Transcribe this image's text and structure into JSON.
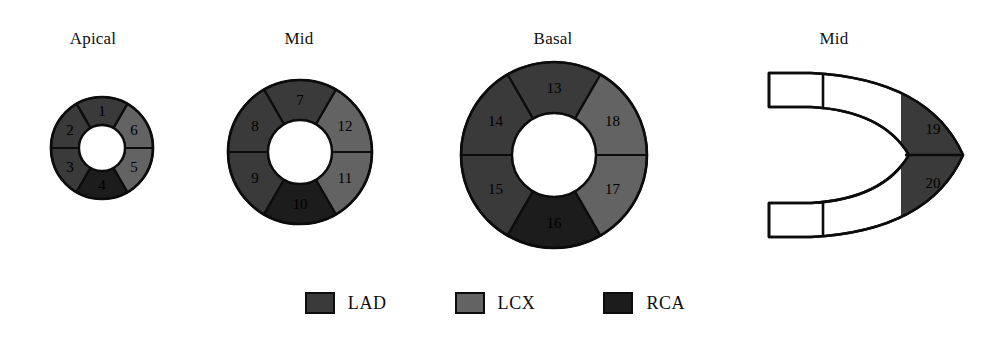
{
  "figure": {
    "background": "#ffffff"
  },
  "colors": {
    "lad": "#3a3a3a",
    "lcx": "#636363",
    "rca": "#1c1c1c",
    "unassigned": "#ffffff",
    "outline": "#0c0c0c",
    "cavity": "#ffffff",
    "label_text": "#000000"
  },
  "panels": [
    {
      "id": "apical",
      "title": "Apical",
      "title_x": 93,
      "title_y": 30,
      "center_x": 102,
      "center_y": 148,
      "outer_radius": 51,
      "inner_radius": 23,
      "segments": [
        {
          "number": "1",
          "territory": "LAD",
          "color_key": "lad",
          "start_angle": -60,
          "end_angle": -120
        },
        {
          "number": "2",
          "territory": "LAD",
          "color_key": "lad",
          "start_angle": -120,
          "end_angle": -180
        },
        {
          "number": "3",
          "territory": "LAD",
          "color_key": "lad",
          "start_angle": 180,
          "end_angle": 120
        },
        {
          "number": "4",
          "territory": "RCA",
          "color_key": "rca",
          "start_angle": 120,
          "end_angle": 60
        },
        {
          "number": "5",
          "territory": "LCX",
          "color_key": "lcx",
          "start_angle": 60,
          "end_angle": 0
        },
        {
          "number": "6",
          "territory": "LCX",
          "color_key": "lcx",
          "start_angle": 0,
          "end_angle": -60
        }
      ]
    },
    {
      "id": "mid",
      "title": "Mid",
      "title_x": 299,
      "title_y": 30,
      "center_x": 300,
      "center_y": 152,
      "outer_radius": 72,
      "inner_radius": 32,
      "segments": [
        {
          "number": "7",
          "territory": "LAD",
          "color_key": "lad",
          "start_angle": -60,
          "end_angle": -120
        },
        {
          "number": "8",
          "territory": "LAD",
          "color_key": "lad",
          "start_angle": -120,
          "end_angle": -180
        },
        {
          "number": "9",
          "territory": "LAD",
          "color_key": "lad",
          "start_angle": 180,
          "end_angle": 120
        },
        {
          "number": "10",
          "territory": "RCA",
          "color_key": "rca",
          "start_angle": 120,
          "end_angle": 60
        },
        {
          "number": "11",
          "territory": "LCX",
          "color_key": "lcx",
          "start_angle": 60,
          "end_angle": 0
        },
        {
          "number": "12",
          "territory": "LCX",
          "color_key": "lcx",
          "start_angle": 0,
          "end_angle": -60
        }
      ]
    },
    {
      "id": "basal",
      "title": "Basal",
      "title_x": 553,
      "title_y": 30,
      "center_x": 554,
      "center_y": 155,
      "outer_radius": 93,
      "inner_radius": 42,
      "segments": [
        {
          "number": "13",
          "territory": "LAD",
          "color_key": "lad",
          "start_angle": -60,
          "end_angle": -120
        },
        {
          "number": "14",
          "territory": "LAD",
          "color_key": "lad",
          "start_angle": -120,
          "end_angle": -180
        },
        {
          "number": "15",
          "territory": "LAD",
          "color_key": "lad",
          "start_angle": 180,
          "end_angle": 120
        },
        {
          "number": "16",
          "territory": "RCA",
          "color_key": "rca",
          "start_angle": 120,
          "end_angle": 60
        },
        {
          "number": "17",
          "territory": "LCX",
          "color_key": "lcx",
          "start_angle": 60,
          "end_angle": 0
        },
        {
          "number": "18",
          "territory": "LCX",
          "color_key": "lcx",
          "start_angle": 0,
          "end_angle": -60
        }
      ]
    }
  ],
  "apex_view": {
    "id": "apex-long-axis",
    "title": "Mid",
    "title_x": 834,
    "title_y": 30,
    "center_x": 866,
    "center_y": 155,
    "segments": [
      {
        "number": "19",
        "territory": "LAD",
        "color_key": "lad",
        "position": "apex-upper"
      },
      {
        "number": "20",
        "territory": "LAD",
        "color_key": "lad",
        "position": "apex-lower"
      }
    ],
    "unshaded_walls": 4
  },
  "legend": {
    "items": [
      {
        "label": "LAD",
        "color_key": "lad",
        "color": "#3a3a3a"
      },
      {
        "label": "LCX",
        "color_key": "lcx",
        "color": "#636363"
      },
      {
        "label": "RCA",
        "color_key": "rca",
        "color": "#1c1c1c"
      }
    ]
  }
}
